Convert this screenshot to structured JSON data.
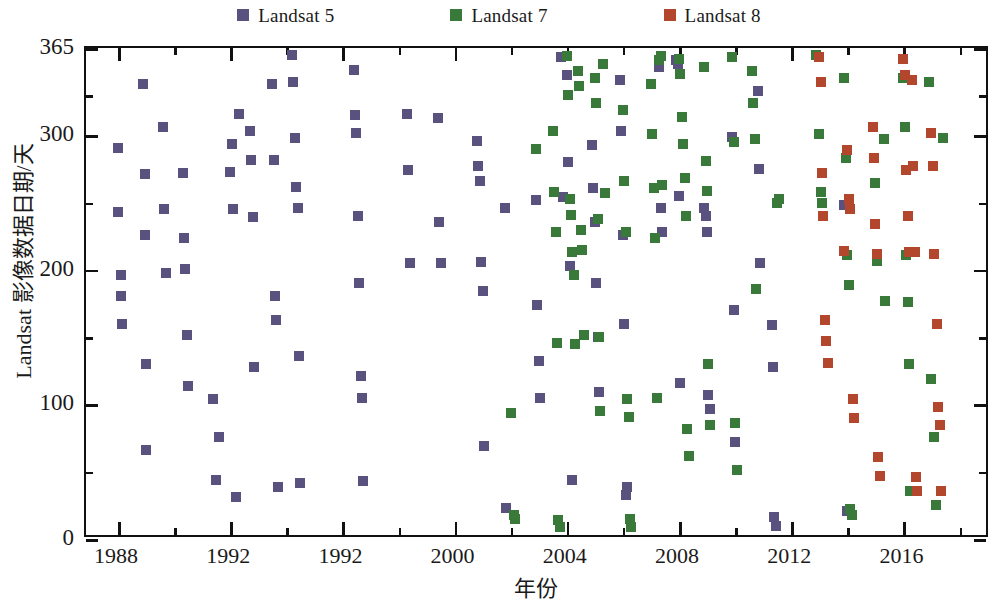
{
  "chart_data": {
    "type": "scatter",
    "title": "",
    "xlabel": "年份",
    "ylabel": "Landsat 影像数据日期/天",
    "xlim": [
      1987.0,
      1919.0
    ],
    "ylim": [
      0,
      365
    ],
    "grid": false,
    "legend_position": "top-center",
    "x_ticks_major": [
      1988,
      1992,
      1992,
      2000,
      2004,
      2008,
      2012,
      2016
    ],
    "x_tick_labels": [
      "1988",
      "1992",
      "1992",
      "2000",
      "2004",
      "2008",
      "2012",
      "2016"
    ],
    "x_ticks_minor": [
      1990,
      1994,
      1998,
      2002,
      2006,
      2010,
      2014,
      2018
    ],
    "y_ticks_major": [
      0,
      100,
      200,
      300,
      365
    ],
    "y_tick_labels": [
      "0",
      "100",
      "200",
      "300",
      "365"
    ],
    "y_ticks_minor": [
      50,
      150,
      250,
      330
    ],
    "series": [
      {
        "name": "Landsat 5",
        "color": "#59527e",
        "marker": "square",
        "points": [
          [
            1988.0,
            291
          ],
          [
            1988.0,
            243
          ],
          [
            1988.1,
            196
          ],
          [
            1988.1,
            181
          ],
          [
            1988.15,
            160
          ],
          [
            1988.9,
            338
          ],
          [
            1988.95,
            271
          ],
          [
            1988.95,
            226
          ],
          [
            1989.0,
            130
          ],
          [
            1989.0,
            66
          ],
          [
            1989.6,
            306
          ],
          [
            1989.65,
            245
          ],
          [
            1989.7,
            198
          ],
          [
            1990.3,
            272
          ],
          [
            1990.35,
            224
          ],
          [
            1990.4,
            201
          ],
          [
            1990.45,
            152
          ],
          [
            1990.5,
            114
          ],
          [
            1991.4,
            104
          ],
          [
            1991.5,
            44
          ],
          [
            1991.6,
            76
          ],
          [
            1992.0,
            273
          ],
          [
            1992.05,
            294
          ],
          [
            1992.1,
            245
          ],
          [
            1992.2,
            31
          ],
          [
            1992.3,
            316
          ],
          [
            1992.7,
            303
          ],
          [
            1992.75,
            282
          ],
          [
            1992.8,
            239
          ],
          [
            1992.85,
            128
          ],
          [
            1993.5,
            338
          ],
          [
            1993.55,
            282
          ],
          [
            1993.6,
            181
          ],
          [
            1993.65,
            163
          ],
          [
            1993.7,
            39
          ],
          [
            1994.2,
            360
          ],
          [
            1994.25,
            340
          ],
          [
            1994.3,
            298
          ],
          [
            1994.35,
            262
          ],
          [
            1994.4,
            246
          ],
          [
            1994.45,
            136
          ],
          [
            1994.5,
            42
          ],
          [
            1996.4,
            349
          ],
          [
            1996.45,
            315
          ],
          [
            1996.5,
            302
          ],
          [
            1996.55,
            240
          ],
          [
            1996.6,
            190
          ],
          [
            1996.65,
            121
          ],
          [
            1996.7,
            105
          ],
          [
            1996.75,
            43
          ],
          [
            1998.3,
            316
          ],
          [
            1998.35,
            274
          ],
          [
            1998.4,
            205
          ],
          [
            1999.4,
            313
          ],
          [
            1999.45,
            236
          ],
          [
            1999.5,
            205
          ],
          [
            2000.8,
            296
          ],
          [
            2000.85,
            277
          ],
          [
            2000.9,
            266
          ],
          [
            2000.95,
            206
          ],
          [
            2001.0,
            184
          ],
          [
            2001.05,
            69
          ],
          [
            2001.8,
            246
          ],
          [
            2001.85,
            23
          ],
          [
            2002.9,
            252
          ],
          [
            2002.95,
            174
          ],
          [
            2003.0,
            132
          ],
          [
            2003.05,
            105
          ],
          [
            2003.8,
            358
          ],
          [
            2003.85,
            254
          ],
          [
            2004.0,
            345
          ],
          [
            2004.05,
            280
          ],
          [
            2004.1,
            203
          ],
          [
            2004.2,
            44
          ],
          [
            2004.9,
            293
          ],
          [
            2004.95,
            261
          ],
          [
            2005.0,
            236
          ],
          [
            2005.05,
            190
          ],
          [
            2005.1,
            150
          ],
          [
            2005.15,
            109
          ],
          [
            2005.9,
            341
          ],
          [
            2005.95,
            303
          ],
          [
            2006.0,
            226
          ],
          [
            2006.05,
            160
          ],
          [
            2006.1,
            33
          ],
          [
            2006.15,
            39
          ],
          [
            2007.3,
            351
          ],
          [
            2007.35,
            246
          ],
          [
            2007.4,
            228
          ],
          [
            2007.9,
            356
          ],
          [
            2007.95,
            353
          ],
          [
            2008.0,
            255
          ],
          [
            2008.05,
            116
          ],
          [
            2008.9,
            246
          ],
          [
            2008.95,
            240
          ],
          [
            2009.0,
            228
          ],
          [
            2009.05,
            107
          ],
          [
            2009.1,
            97
          ],
          [
            2009.9,
            299
          ],
          [
            2009.95,
            170
          ],
          [
            2009.98,
            72
          ],
          [
            2010.8,
            333
          ],
          [
            2010.85,
            275
          ],
          [
            2010.9,
            205
          ],
          [
            2011.3,
            159
          ],
          [
            2011.35,
            128
          ],
          [
            2011.4,
            16
          ],
          [
            2011.45,
            10
          ],
          [
            2013.9,
            248
          ],
          [
            2014.0,
            21
          ]
        ]
      },
      {
        "name": "Landsat 7",
        "color": "#39793a",
        "marker": "square",
        "points": [
          [
            2002.0,
            94
          ],
          [
            2002.1,
            18
          ],
          [
            2002.15,
            15
          ],
          [
            2002.9,
            290
          ],
          [
            2003.5,
            303
          ],
          [
            2003.55,
            258
          ],
          [
            2003.6,
            228
          ],
          [
            2003.65,
            146
          ],
          [
            2003.7,
            14
          ],
          [
            2003.75,
            9
          ],
          [
            2004.0,
            359
          ],
          [
            2004.05,
            330
          ],
          [
            2004.1,
            253
          ],
          [
            2004.15,
            241
          ],
          [
            2004.2,
            213
          ],
          [
            2004.25,
            196
          ],
          [
            2004.3,
            145
          ],
          [
            2004.4,
            348
          ],
          [
            2004.45,
            337
          ],
          [
            2004.5,
            230
          ],
          [
            2004.55,
            215
          ],
          [
            2004.6,
            152
          ],
          [
            2005.0,
            343
          ],
          [
            2005.05,
            324
          ],
          [
            2005.1,
            238
          ],
          [
            2005.15,
            150
          ],
          [
            2005.2,
            95
          ],
          [
            2005.3,
            353
          ],
          [
            2005.35,
            257
          ],
          [
            2006.0,
            319
          ],
          [
            2006.05,
            266
          ],
          [
            2006.1,
            228
          ],
          [
            2006.15,
            104
          ],
          [
            2006.2,
            91
          ],
          [
            2006.25,
            15
          ],
          [
            2006.3,
            9
          ],
          [
            2007.0,
            338
          ],
          [
            2007.05,
            301
          ],
          [
            2007.1,
            261
          ],
          [
            2007.15,
            224
          ],
          [
            2007.2,
            105
          ],
          [
            2007.3,
            356
          ],
          [
            2007.35,
            359
          ],
          [
            2007.4,
            263
          ],
          [
            2008.0,
            357
          ],
          [
            2008.05,
            346
          ],
          [
            2008.1,
            314
          ],
          [
            2008.15,
            294
          ],
          [
            2008.2,
            268
          ],
          [
            2008.25,
            240
          ],
          [
            2008.3,
            82
          ],
          [
            2008.35,
            62
          ],
          [
            2008.9,
            351
          ],
          [
            2008.95,
            281
          ],
          [
            2009.0,
            259
          ],
          [
            2009.05,
            130
          ],
          [
            2009.1,
            85
          ],
          [
            2009.9,
            358
          ],
          [
            2009.95,
            295
          ],
          [
            2010.0,
            86
          ],
          [
            2010.05,
            51
          ],
          [
            2010.6,
            348
          ],
          [
            2010.65,
            324
          ],
          [
            2010.7,
            297
          ],
          [
            2010.75,
            186
          ],
          [
            2011.5,
            250
          ],
          [
            2011.55,
            253
          ],
          [
            2012.9,
            360
          ],
          [
            2013.0,
            301
          ],
          [
            2013.05,
            258
          ],
          [
            2013.1,
            250
          ],
          [
            2013.9,
            343
          ],
          [
            2013.95,
            283
          ],
          [
            2014.0,
            211
          ],
          [
            2014.05,
            189
          ],
          [
            2014.1,
            22
          ],
          [
            2014.15,
            18
          ],
          [
            2015.0,
            265
          ],
          [
            2015.05,
            207
          ],
          [
            2015.3,
            297
          ],
          [
            2015.35,
            177
          ],
          [
            2016.0,
            343
          ],
          [
            2016.05,
            306
          ],
          [
            2016.1,
            211
          ],
          [
            2016.15,
            176
          ],
          [
            2016.2,
            130
          ],
          [
            2016.25,
            36
          ],
          [
            2016.9,
            340
          ],
          [
            2017.0,
            119
          ],
          [
            2017.1,
            76
          ],
          [
            2017.15,
            25
          ],
          [
            2017.4,
            298
          ]
        ]
      },
      {
        "name": "Landsat 8",
        "color": "#b2472e",
        "marker": "square",
        "points": [
          [
            2013.0,
            358
          ],
          [
            2013.05,
            340
          ],
          [
            2013.1,
            272
          ],
          [
            2013.15,
            240
          ],
          [
            2013.2,
            163
          ],
          [
            2013.25,
            147
          ],
          [
            2013.3,
            131
          ],
          [
            2013.9,
            214
          ],
          [
            2014.0,
            289
          ],
          [
            2014.05,
            253
          ],
          [
            2014.1,
            245
          ],
          [
            2014.2,
            104
          ],
          [
            2014.25,
            90
          ],
          [
            2014.9,
            306
          ],
          [
            2014.95,
            283
          ],
          [
            2015.0,
            234
          ],
          [
            2015.05,
            212
          ],
          [
            2015.1,
            61
          ],
          [
            2015.15,
            47
          ],
          [
            2016.0,
            357
          ],
          [
            2016.05,
            345
          ],
          [
            2016.1,
            274
          ],
          [
            2016.15,
            240
          ],
          [
            2016.2,
            213
          ],
          [
            2016.3,
            341
          ],
          [
            2016.35,
            277
          ],
          [
            2016.4,
            213
          ],
          [
            2016.45,
            46
          ],
          [
            2016.5,
            36
          ],
          [
            2017.0,
            302
          ],
          [
            2017.05,
            277
          ],
          [
            2017.1,
            212
          ],
          [
            2017.2,
            160
          ],
          [
            2017.25,
            98
          ],
          [
            2017.3,
            85
          ],
          [
            2017.35,
            36
          ]
        ]
      }
    ]
  },
  "legend": {
    "items": [
      {
        "label": "Landsat 5",
        "color": "#59527e"
      },
      {
        "label": "Landsat 7",
        "color": "#39793a"
      },
      {
        "label": "Landsat 8",
        "color": "#b2472e"
      }
    ]
  },
  "axes": {
    "y_title": "Landsat 影像数据日期/天",
    "x_title": "年份"
  }
}
